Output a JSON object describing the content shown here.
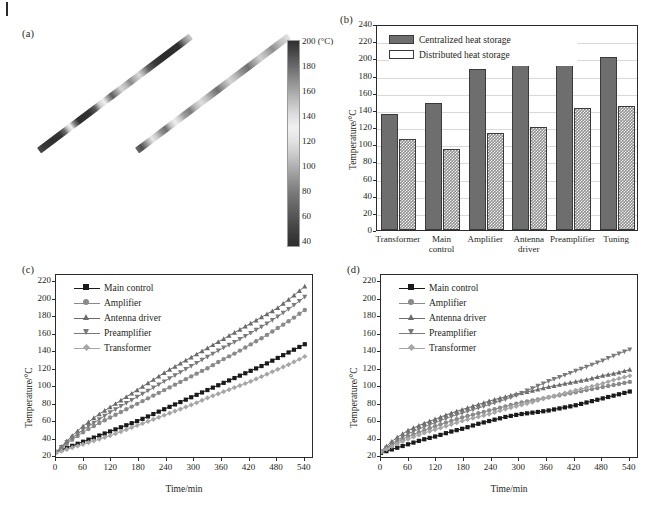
{
  "figure": {
    "panels": [
      "(a)",
      "(b)",
      "(c)",
      "(d)"
    ],
    "caption_fragment": ""
  },
  "panel_a": {
    "label": "(a)",
    "colorbar": {
      "unit_label": "200 (°C)",
      "ticks": [
        "200 (°C)",
        "180",
        "160",
        "140",
        "120",
        "100",
        "80",
        "60",
        "40"
      ],
      "tick_values": [
        200,
        180,
        160,
        140,
        120,
        100,
        80,
        60,
        40
      ],
      "min": 40,
      "max": 200
    },
    "thermal_images": [
      {
        "name": "antenna-rod-centralized"
      },
      {
        "name": "antenna-rod-distributed"
      }
    ]
  },
  "chart_data": [
    {
      "panel": "(b)",
      "type": "bar",
      "title": "",
      "xlabel": "",
      "ylabel": "Temperature/°C",
      "ylim": [
        0,
        240
      ],
      "ytick_step": 20,
      "yticks": [
        0,
        20,
        40,
        60,
        80,
        100,
        120,
        140,
        160,
        180,
        200,
        220,
        240
      ],
      "grid": true,
      "legend_position": "top-left",
      "categories": [
        "Transformer",
        "Main control",
        "Amplifier",
        "Antenna driver",
        "Preamplifier",
        "Tuning"
      ],
      "series": [
        {
          "name": "Centralized heat storage",
          "values": [
            135,
            148,
            188,
            215,
            202,
            202
          ],
          "fill": "solid",
          "color": "#6e6e6e"
        },
        {
          "name": "Distributed heat storage",
          "values": [
            106,
            95,
            113,
            120,
            142,
            145
          ],
          "fill": "hatch",
          "color": "#8f8f8f"
        }
      ]
    },
    {
      "panel": "(c)",
      "type": "line",
      "title": "",
      "xlabel": "Time/min",
      "ylabel": "Temperature/°C",
      "xlim": [
        0,
        560
      ],
      "ylim": [
        18,
        228
      ],
      "xticks": [
        0,
        60,
        120,
        180,
        240,
        300,
        360,
        420,
        480,
        540
      ],
      "yticks": [
        20,
        40,
        60,
        80,
        100,
        120,
        140,
        160,
        180,
        200,
        220
      ],
      "grid": false,
      "legend_position": "top-left",
      "x": [
        0,
        30,
        60,
        90,
        120,
        150,
        180,
        210,
        240,
        270,
        300,
        330,
        360,
        390,
        420,
        450,
        480,
        510,
        540
      ],
      "series": [
        {
          "name": "Main control",
          "marker": "square",
          "color": "#1a1a1a",
          "values": [
            26,
            32,
            38,
            44,
            50,
            56,
            62,
            69,
            76,
            83,
            90,
            97,
            104,
            111,
            118,
            125,
            133,
            141,
            149
          ]
        },
        {
          "name": "Amplifier",
          "marker": "circle",
          "color": "#8a8a8a",
          "values": [
            26,
            38,
            49,
            58,
            66,
            74,
            82,
            90,
            98,
            106,
            114,
            122,
            131,
            139,
            148,
            157,
            167,
            177,
            188
          ]
        },
        {
          "name": "Antenna driver",
          "marker": "triangle-up",
          "color": "#6b6b6b",
          "values": [
            26,
            42,
            56,
            68,
            78,
            88,
            98,
            108,
            118,
            127,
            136,
            145,
            154,
            163,
            172,
            181,
            190,
            202,
            215
          ]
        },
        {
          "name": "Preamplifier",
          "marker": "triangle-down",
          "color": "#7a7a7a",
          "values": [
            26,
            40,
            52,
            62,
            72,
            81,
            90,
            99,
            108,
            117,
            126,
            135,
            144,
            152,
            161,
            170,
            180,
            191,
            203
          ]
        },
        {
          "name": "Transformer",
          "marker": "diamond",
          "color": "#a6a6a6",
          "values": [
            25,
            30,
            35,
            40,
            45,
            51,
            57,
            63,
            69,
            75,
            81,
            88,
            94,
            100,
            106,
            113,
            120,
            127,
            135
          ]
        }
      ]
    },
    {
      "panel": "(d)",
      "type": "line",
      "title": "",
      "xlabel": "Time/min",
      "ylabel": "Temperature/°C",
      "xlim": [
        0,
        560
      ],
      "ylim": [
        18,
        228
      ],
      "xticks": [
        0,
        60,
        120,
        180,
        240,
        300,
        360,
        420,
        480,
        540
      ],
      "yticks": [
        20,
        40,
        60,
        80,
        100,
        120,
        140,
        160,
        180,
        200,
        220
      ],
      "grid": false,
      "legend_position": "top-left",
      "x": [
        0,
        30,
        60,
        90,
        120,
        150,
        180,
        210,
        240,
        270,
        300,
        330,
        360,
        390,
        420,
        450,
        480,
        510,
        540
      ],
      "series": [
        {
          "name": "Main control",
          "marker": "square",
          "color": "#1a1a1a",
          "values": [
            25,
            30,
            35,
            40,
            44,
            49,
            53,
            58,
            62,
            66,
            69,
            71,
            73,
            76,
            79,
            83,
            87,
            91,
            95
          ]
        },
        {
          "name": "Amplifier",
          "marker": "circle",
          "color": "#8a8a8a",
          "values": [
            26,
            36,
            44,
            50,
            56,
            61,
            66,
            70,
            74,
            78,
            82,
            85,
            88,
            91,
            94,
            97,
            100,
            103,
            106
          ]
        },
        {
          "name": "Antenna driver",
          "marker": "triangle-up",
          "color": "#6b6b6b",
          "values": [
            27,
            41,
            51,
            58,
            64,
            70,
            75,
            80,
            85,
            89,
            93,
            96,
            100,
            103,
            106,
            109,
            113,
            116,
            120
          ]
        },
        {
          "name": "Preamplifier",
          "marker": "triangle-down",
          "color": "#7a7a7a",
          "values": [
            26,
            38,
            47,
            54,
            60,
            66,
            71,
            76,
            81,
            86,
            92,
            99,
            106,
            112,
            118,
            124,
            130,
            137,
            143
          ]
        },
        {
          "name": "Transformer",
          "marker": "diamond",
          "color": "#a6a6a6",
          "values": [
            26,
            34,
            41,
            47,
            52,
            57,
            62,
            66,
            70,
            75,
            79,
            83,
            88,
            92,
            96,
            100,
            104,
            109,
            113
          ]
        }
      ]
    }
  ],
  "panel_b": {
    "label": "(b)"
  },
  "panel_c": {
    "label": "(c)"
  },
  "panel_d": {
    "label": "(d)"
  }
}
